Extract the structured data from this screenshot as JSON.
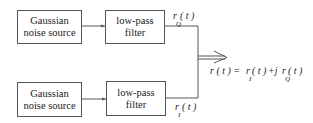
{
  "diagram": {
    "top_branch": {
      "source": {
        "line1": "Gaussian",
        "line2": "noise source"
      },
      "filter": {
        "line1": "low-pass",
        "line2": "filter"
      },
      "output_label": {
        "symbol": "r",
        "arg": "( t )",
        "subscript": "Q"
      }
    },
    "bottom_branch": {
      "source": {
        "line1": "Gaussian",
        "line2": "noise source"
      },
      "filter": {
        "line1": "low-pass",
        "line2": "filter"
      },
      "output_label": {
        "symbol": "r",
        "arg": "( t )",
        "subscript": "I"
      }
    },
    "combined": {
      "lhs": "r ( t ) =",
      "term1_symbol": "r",
      "term1_arg": "( t )",
      "term1_sub": "I",
      "plus_j": "+j",
      "term2_symbol": "r",
      "term2_arg": "( t )",
      "term2_sub": "Q"
    },
    "colors": {
      "line": "#555555",
      "text": "#222222",
      "background": "#ffffff"
    }
  }
}
